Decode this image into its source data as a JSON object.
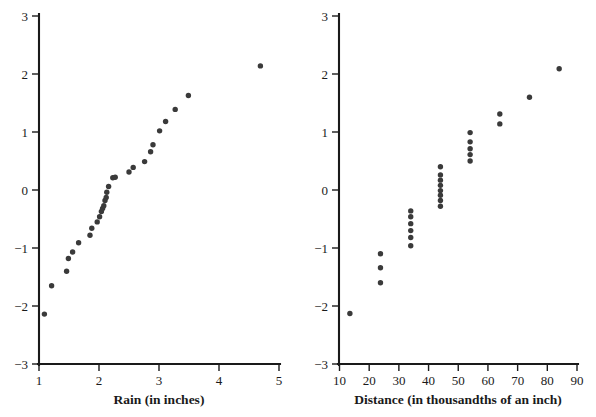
{
  "figure": {
    "background": "#ffffff",
    "dot_color": "#3a3a3a",
    "axis_color": "#1a1a1a"
  },
  "chart_data": [
    {
      "type": "scatter",
      "panel": "left",
      "title": "",
      "xlabel": "Rain (in inches)",
      "ylabel": "",
      "xlim": [
        1,
        5
      ],
      "ylim": [
        -3,
        3
      ],
      "xticks": [
        1,
        2,
        3,
        4,
        5
      ],
      "xtick_labels": [
        "1",
        "2",
        "3",
        "4",
        "5"
      ],
      "yticks": [
        -3,
        -2,
        -1,
        0,
        1,
        2,
        3
      ],
      "ytick_labels": [
        "−3",
        "−2",
        "−1",
        "0",
        "1",
        "2",
        "3"
      ],
      "grid": false,
      "legend": "none",
      "points": [
        {
          "x": 1.09,
          "y": -2.14
        },
        {
          "x": 1.21,
          "y": -1.65
        },
        {
          "x": 1.46,
          "y": -1.4
        },
        {
          "x": 1.49,
          "y": -1.18
        },
        {
          "x": 1.56,
          "y": -1.07
        },
        {
          "x": 1.66,
          "y": -0.91
        },
        {
          "x": 1.85,
          "y": -0.78
        },
        {
          "x": 1.88,
          "y": -0.66
        },
        {
          "x": 1.97,
          "y": -0.55
        },
        {
          "x": 2.01,
          "y": -0.46
        },
        {
          "x": 2.04,
          "y": -0.37
        },
        {
          "x": 2.06,
          "y": -0.32
        },
        {
          "x": 2.08,
          "y": -0.27
        },
        {
          "x": 2.1,
          "y": -0.18
        },
        {
          "x": 2.12,
          "y": -0.13
        },
        {
          "x": 2.13,
          "y": -0.04
        },
        {
          "x": 2.16,
          "y": 0.06
        },
        {
          "x": 2.23,
          "y": 0.21
        },
        {
          "x": 2.27,
          "y": 0.22
        },
        {
          "x": 2.5,
          "y": 0.31
        },
        {
          "x": 2.57,
          "y": 0.39
        },
        {
          "x": 2.76,
          "y": 0.49
        },
        {
          "x": 2.86,
          "y": 0.66
        },
        {
          "x": 2.9,
          "y": 0.78
        },
        {
          "x": 3.01,
          "y": 1.02
        },
        {
          "x": 3.11,
          "y": 1.18
        },
        {
          "x": 3.27,
          "y": 1.39
        },
        {
          "x": 3.49,
          "y": 1.63
        },
        {
          "x": 4.69,
          "y": 2.14
        }
      ]
    },
    {
      "type": "scatter",
      "panel": "right",
      "title": "",
      "xlabel": "Distance (in thousandths of an inch)",
      "ylabel": "",
      "xlim": [
        10,
        90
      ],
      "ylim": [
        -3,
        3
      ],
      "xticks": [
        10,
        20,
        30,
        40,
        50,
        60,
        70,
        80,
        90
      ],
      "xtick_labels": [
        "10",
        "20",
        "30",
        "40",
        "50",
        "60",
        "70",
        "80",
        "90"
      ],
      "yticks": [
        -3,
        -2,
        -1,
        0,
        1,
        2,
        3
      ],
      "ytick_labels": [
        "−3",
        "−2",
        "−1",
        "0",
        "1",
        "2",
        "3"
      ],
      "grid": false,
      "legend": "none",
      "points": [
        {
          "x": 13.5,
          "y": -2.13
        },
        {
          "x": 23.8,
          "y": -1.6
        },
        {
          "x": 23.8,
          "y": -1.34
        },
        {
          "x": 23.8,
          "y": -1.1
        },
        {
          "x": 34.0,
          "y": -0.96
        },
        {
          "x": 34.0,
          "y": -0.82
        },
        {
          "x": 34.0,
          "y": -0.7
        },
        {
          "x": 34.0,
          "y": -0.58
        },
        {
          "x": 34.0,
          "y": -0.46
        },
        {
          "x": 34.0,
          "y": -0.36
        },
        {
          "x": 44.0,
          "y": -0.28
        },
        {
          "x": 44.0,
          "y": -0.18
        },
        {
          "x": 44.0,
          "y": -0.09
        },
        {
          "x": 44.0,
          "y": -0.01
        },
        {
          "x": 44.0,
          "y": 0.08
        },
        {
          "x": 44.0,
          "y": 0.17
        },
        {
          "x": 44.0,
          "y": 0.26
        },
        {
          "x": 44.0,
          "y": 0.4
        },
        {
          "x": 54.0,
          "y": 0.5
        },
        {
          "x": 54.0,
          "y": 0.61
        },
        {
          "x": 54.0,
          "y": 0.71
        },
        {
          "x": 54.0,
          "y": 0.83
        },
        {
          "x": 54.0,
          "y": 0.99
        },
        {
          "x": 64.0,
          "y": 1.14
        },
        {
          "x": 64.0,
          "y": 1.31
        },
        {
          "x": 74.0,
          "y": 1.6
        },
        {
          "x": 84.0,
          "y": 2.09
        }
      ]
    }
  ]
}
